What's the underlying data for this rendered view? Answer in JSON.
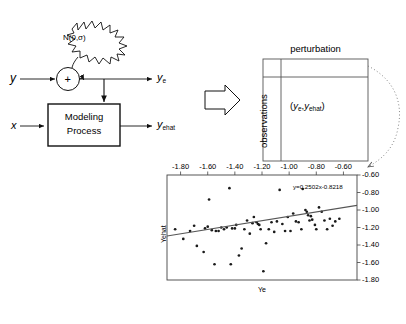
{
  "figure": {
    "block_diagram": {
      "input_y_label": "y",
      "input_x_label": "x",
      "noise_label": "N(0,σ)",
      "sum_label": "+",
      "process_label_line1": "Modeling",
      "process_label_line2": "Process",
      "output_ye_base": "y",
      "output_ye_sub": "e",
      "output_yehat_base": "y",
      "output_yehat_sub": "ehat",
      "big_arrow_icon": "block-arrow-right-icon"
    },
    "matrix": {
      "column_header": "perturbation",
      "row_header": "observations",
      "cell_open": "(",
      "cell_y1_base": "y",
      "cell_y1_sub": "e",
      "cell_sep": ",",
      "cell_y2_base": "y",
      "cell_y2_sub": "ehat",
      "cell_close": ")"
    }
  },
  "chart_data": {
    "type": "scatter",
    "title": "",
    "xlabel": "Ye",
    "ylabel": "Yehat",
    "xlim": [
      -1.9,
      -0.5
    ],
    "ylim": [
      -1.8,
      -0.6
    ],
    "x_axis_position": "top",
    "y_axis_position": "right",
    "y_inverted": true,
    "grid": false,
    "xticks": [
      "-1.80",
      "-1.60",
      "-1.40",
      "-1.20",
      "-1.00",
      "-0.80",
      "-0.60"
    ],
    "xtick_values": [
      -1.8,
      -1.6,
      -1.4,
      -1.2,
      -1.0,
      -0.8,
      -0.6
    ],
    "yticks": [
      "-0.60",
      "-0.80",
      "-1.00",
      "-1.20",
      "-1.40",
      "-1.60",
      "-1.80"
    ],
    "ytick_values": [
      -0.6,
      -0.8,
      -1.0,
      -1.2,
      -1.4,
      -1.6,
      -1.8
    ],
    "annotation": "y=0.2502x-0.8218",
    "trendline": {
      "slope": 0.2502,
      "intercept": -0.8218
    },
    "marker": "dot",
    "marker_color": "#1a1a1a",
    "line_color": "#555555",
    "points": [
      [
        -1.84,
        -1.22
      ],
      [
        -1.78,
        -1.33
      ],
      [
        -1.73,
        -1.24
      ],
      [
        -1.7,
        -1.18
      ],
      [
        -1.68,
        -1.41
      ],
      [
        -1.63,
        -1.48
      ],
      [
        -1.62,
        -1.21
      ],
      [
        -1.6,
        -1.19
      ],
      [
        -1.59,
        -0.88
      ],
      [
        -1.57,
        -1.23
      ],
      [
        -1.55,
        -1.62
      ],
      [
        -1.54,
        -1.24
      ],
      [
        -1.52,
        -1.24
      ],
      [
        -1.5,
        -1.2
      ],
      [
        -1.48,
        -1.22
      ],
      [
        -1.46,
        -1.2
      ],
      [
        -1.44,
        -0.75
      ],
      [
        -1.43,
        -1.62
      ],
      [
        -1.42,
        -1.21
      ],
      [
        -1.4,
        -1.21
      ],
      [
        -1.39,
        -1.17
      ],
      [
        -1.37,
        -1.52
      ],
      [
        -1.35,
        -1.44
      ],
      [
        -1.33,
        -1.22
      ],
      [
        -1.31,
        -1.12
      ],
      [
        -1.29,
        -1.27
      ],
      [
        -1.27,
        -1.15
      ],
      [
        -1.26,
        -1.08
      ],
      [
        -1.24,
        -1.14
      ],
      [
        -1.23,
        -1.16
      ],
      [
        -1.22,
        -1.17
      ],
      [
        -1.21,
        -1.22
      ],
      [
        -1.19,
        -1.7
      ],
      [
        -1.17,
        -1.38
      ],
      [
        -1.15,
        -1.22
      ],
      [
        -1.13,
        -1.14
      ],
      [
        -1.11,
        -1.25
      ],
      [
        -1.09,
        -1.13
      ],
      [
        -1.07,
        -0.77
      ],
      [
        -1.05,
        -1.16
      ],
      [
        -1.03,
        -1.24
      ],
      [
        -1.01,
        -1.08
      ],
      [
        -0.99,
        -1.24
      ],
      [
        -0.97,
        -1.04
      ],
      [
        -0.95,
        -1.13
      ],
      [
        -0.93,
        -1.14
      ],
      [
        -0.91,
        -1.22
      ],
      [
        -0.9,
        -0.76
      ],
      [
        -0.88,
        -1.0
      ],
      [
        -0.87,
        -1.02
      ],
      [
        -0.86,
        -1.06
      ],
      [
        -0.85,
        -1.12
      ],
      [
        -0.84,
        -1.07
      ],
      [
        -0.83,
        -1.11
      ],
      [
        -0.81,
        -1.17
      ],
      [
        -0.8,
        -1.22
      ],
      [
        -0.78,
        -0.97
      ],
      [
        -0.76,
        -1.02
      ],
      [
        -0.74,
        -1.12
      ],
      [
        -0.72,
        -1.22
      ],
      [
        -0.7,
        -1.1
      ],
      [
        -0.68,
        -1.18
      ],
      [
        -0.66,
        -1.13
      ],
      [
        -0.63,
        -1.1
      ]
    ]
  }
}
